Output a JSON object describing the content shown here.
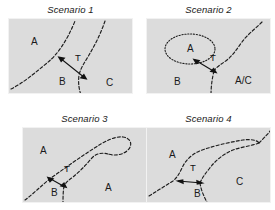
{
  "figure": {
    "background": "#ffffff",
    "panel_fill": "#dcdcdc",
    "line_color": "#1d1d1d",
    "text_color": "#1a1a1a"
  },
  "panels": [
    {
      "id": "scenario-1",
      "title": "Scenario 1",
      "regions": [
        {
          "key": "A",
          "label": "A",
          "x": 22,
          "y": 26
        },
        {
          "key": "B",
          "label": "B",
          "x": 50,
          "y": 66
        },
        {
          "key": "C",
          "label": "C",
          "x": 97,
          "y": 67
        }
      ],
      "transition": {
        "label": "T",
        "x": 66,
        "y": 42
      }
    },
    {
      "id": "scenario-2",
      "title": "Scenario 2",
      "regions": [
        {
          "key": "A",
          "label": "A",
          "x": 40,
          "y": 33
        },
        {
          "key": "B",
          "label": "B",
          "x": 27,
          "y": 66
        },
        {
          "key": "AC",
          "label": "A/C",
          "x": 88,
          "y": 65
        }
      ],
      "transition": {
        "label": "T",
        "x": 63,
        "y": 42
      }
    },
    {
      "id": "scenario-3",
      "title": "Scenario 3",
      "regions": [
        {
          "key": "A-left",
          "label": "A",
          "x": 17,
          "y": 26
        },
        {
          "key": "B",
          "label": "B",
          "x": 28,
          "y": 68
        },
        {
          "key": "A-right",
          "label": "A",
          "x": 82,
          "y": 63
        }
      ],
      "transition": {
        "label": "T",
        "x": 41,
        "y": 44
      }
    },
    {
      "id": "scenario-4",
      "title": "Scenario 4",
      "regions": [
        {
          "key": "A",
          "label": "A",
          "x": 22,
          "y": 30
        },
        {
          "key": "B",
          "label": "B",
          "x": 47,
          "y": 69
        },
        {
          "key": "C",
          "label": "C",
          "x": 89,
          "y": 57
        }
      ],
      "transition": {
        "label": "T",
        "x": 43,
        "y": 43
      }
    }
  ]
}
